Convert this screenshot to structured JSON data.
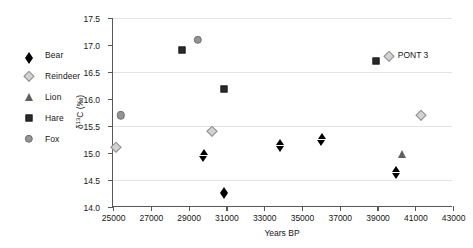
{
  "chart_data": {
    "type": "scatter",
    "title": "",
    "xlabel": "Years BP",
    "ylabel": "δ¹³C (‰)",
    "ylabel_parts": {
      "delta": "δ",
      "superscript": "13",
      "rest": "C (‰)"
    },
    "xlim": [
      25000,
      43000
    ],
    "ylim": [
      14.0,
      17.5
    ],
    "xticks": [
      25000,
      27000,
      29000,
      31000,
      33000,
      35000,
      37000,
      39000,
      41000,
      43000
    ],
    "xtick_labels": [
      "25000",
      "27000",
      "29000",
      "31000",
      "33000",
      "35000",
      "37000",
      "39000",
      "41000",
      "43000"
    ],
    "yticks": [
      14.0,
      14.5,
      15.0,
      15.5,
      16.0,
      16.5,
      17.0,
      17.5
    ],
    "ytick_labels": [
      "14.0",
      "14.5",
      "15.0",
      "15.5",
      "16.0",
      "16.5",
      "17.0",
      "17.5"
    ],
    "grid": true,
    "gridlines_y": [
      14.5,
      15.5,
      16.5,
      17.5
    ],
    "legend_position": "left-outside",
    "series": [
      {
        "name": "Bear",
        "marker": "diamond-filled",
        "color": "#000000",
        "points": [
          {
            "x": 29800,
            "y": 15.01
          },
          {
            "x": 30900,
            "y": 14.32
          },
          {
            "x": 33850,
            "y": 15.2
          },
          {
            "x": 36050,
            "y": 15.31
          },
          {
            "x": 39980,
            "y": 14.7
          }
        ]
      },
      {
        "name": "Reindeer",
        "marker": "diamond-open",
        "color": "#d2d2d2",
        "points": [
          {
            "x": 25150,
            "y": 15.11
          },
          {
            "x": 30250,
            "y": 15.4
          },
          {
            "x": 39600,
            "y": 16.8
          },
          {
            "x": 41300,
            "y": 15.7
          }
        ]
      },
      {
        "name": "Lion",
        "marker": "triangle",
        "color": "#5f5f5f",
        "points": [
          {
            "x": 40300,
            "y": 14.99
          }
        ]
      },
      {
        "name": "Hare",
        "marker": "square",
        "color": "#2a2a2a",
        "points": [
          {
            "x": 28650,
            "y": 16.91
          },
          {
            "x": 30880,
            "y": 16.19
          },
          {
            "x": 38920,
            "y": 16.7
          }
        ]
      },
      {
        "name": "Fox",
        "marker": "circle",
        "color": "#949494",
        "points": [
          {
            "x": 25400,
            "y": 15.7
          },
          {
            "x": 29500,
            "y": 17.1
          }
        ]
      }
    ],
    "annotations": [
      {
        "text": "PONT 3",
        "x": 39600,
        "y": 16.8,
        "marker": "diamond-open",
        "series": "Reindeer"
      }
    ]
  },
  "legend": {
    "items": [
      {
        "label": "Bear",
        "marker": "diamond-filled"
      },
      {
        "label": "Reindeer",
        "marker": "diamond-open"
      },
      {
        "label": "Lion",
        "marker": "triangle"
      },
      {
        "label": "Hare",
        "marker": "square"
      },
      {
        "label": "Fox",
        "marker": "circle"
      }
    ]
  }
}
